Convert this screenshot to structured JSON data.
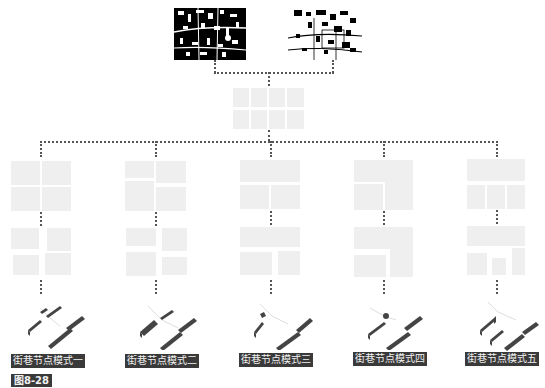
{
  "figure": {
    "caption_number": "图8-28",
    "source_maps": [
      {
        "name": "figure-ground-map-dense",
        "style": "black-ground-white-streets"
      },
      {
        "name": "figure-ground-map-sparse",
        "style": "white-ground-black-buildings"
      }
    ],
    "connector_color": "#555555",
    "block_color": "#efefef",
    "label_bg": "#3a3a3a",
    "label_fg": "#f2f2f2",
    "patterns": [
      {
        "label": "街巷节点模式一"
      },
      {
        "label": "街巷节点模式二"
      },
      {
        "label": "街巷节点模式三"
      },
      {
        "label": "街巷节点模式四"
      },
      {
        "label": "街巷节点模式五"
      }
    ]
  }
}
